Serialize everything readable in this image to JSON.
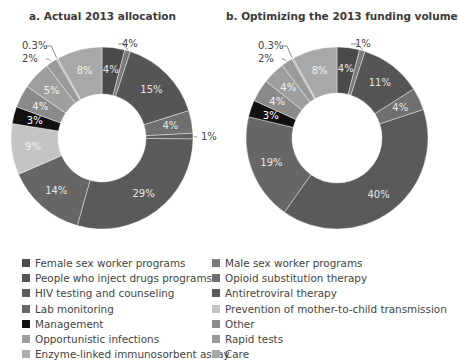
{
  "chart_data": [
    {
      "type": "pie",
      "style": "donut",
      "title": "a. Actual 2013 allocation",
      "categories": [
        "Female sex worker programs",
        "Male sex worker programs",
        "People who inject drugs programs",
        "Opioid substitution therapy",
        "HIV testing and counseling",
        "Antiretroviral therapy",
        "Lab monitoring",
        "Prevention of mother-to-child transmission",
        "Management",
        "Other",
        "Opportunistic infections",
        "Rapid tests",
        "Enzyme-linked immunosorbent assay",
        "Care"
      ],
      "values": [
        4,
        1,
        15,
        4,
        1,
        29,
        14,
        9,
        3,
        4,
        5,
        2,
        0.3,
        8
      ],
      "labels": [
        "4%",
        "4%",
        "15%",
        "4%",
        "1%",
        "29%",
        "14%",
        "9%",
        "3%",
        "4%",
        "5%",
        "2%",
        "0.3%",
        "8%"
      ]
    },
    {
      "type": "pie",
      "style": "donut",
      "title": "b. Optimizing the 2013 funding volume",
      "categories": [
        "Female sex worker programs",
        "Male sex worker programs",
        "People who inject drugs programs",
        "Opioid substitution therapy",
        "HIV testing and counseling",
        "Antiretroviral therapy",
        "Lab monitoring",
        "Prevention of mother-to-child transmission",
        "Management",
        "Other",
        "Opportunistic infections",
        "Rapid tests",
        "Enzyme-linked immunosorbent assay",
        "Care"
      ],
      "values": [
        4,
        1,
        11,
        4,
        0,
        40,
        19,
        0,
        3,
        4,
        4,
        2,
        0.3,
        8
      ],
      "labels": [
        "4%",
        "1%",
        "11%",
        "4%",
        "",
        "40%",
        "19%",
        "",
        "3%",
        "4%",
        "4%",
        "2%",
        "0.3%",
        "8%"
      ]
    }
  ],
  "titles": {
    "a": "a. Actual 2013 allocation",
    "b": "b. Optimizing the 2013 funding volume"
  },
  "colors": {
    "Female sex worker programs": "#4a4a4a",
    "Male sex worker programs": "#7a7a7a",
    "People who inject drugs programs": "#555555",
    "Opioid substitution therapy": "#707070",
    "HIV testing and counseling": "#5e5e5e",
    "Antiretroviral therapy": "#5a5a5a",
    "Lab monitoring": "#666666",
    "Prevention of mother-to-child transmission": "#c4c4c4",
    "Management": "#111111",
    "Other": "#8a8a8a",
    "Opportunistic infections": "#9e9e9e",
    "Rapid tests": "#9a9a9a",
    "Enzyme-linked immunosorbent assay": "#acacac",
    "Care": "#a8a8a8"
  },
  "legend": {
    "left": [
      "Female sex worker programs",
      "People who inject drugs programs",
      "HIV testing and counseling",
      "Lab monitoring",
      "Management",
      "Opportunistic infections",
      "Enzyme-linked immunosorbent assay"
    ],
    "right": [
      "Male sex worker programs",
      "Opioid substitution therapy",
      "Antiretroviral therapy",
      "Prevention of mother-to-child transmission",
      "Other",
      "Rapid tests",
      "Care"
    ]
  }
}
